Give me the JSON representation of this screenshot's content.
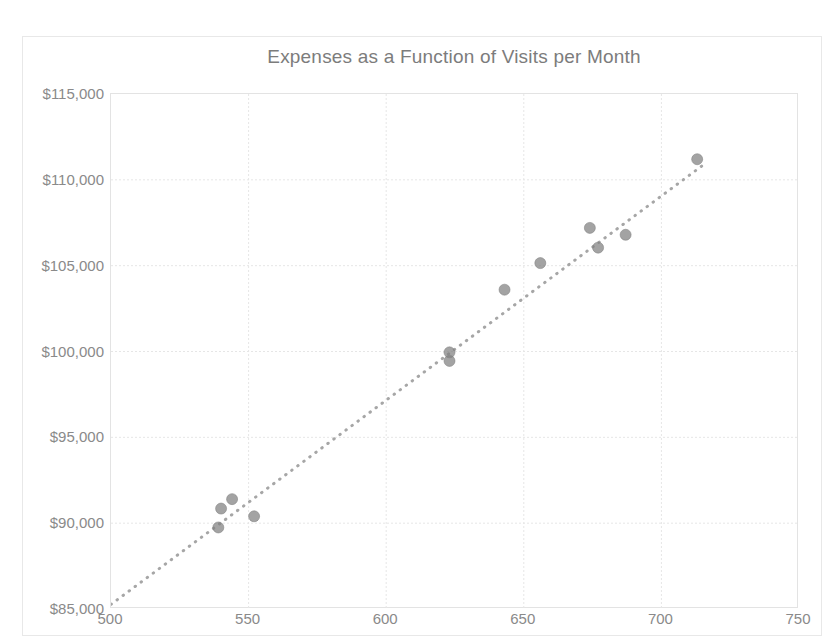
{
  "chart_data": {
    "type": "scatter",
    "title": "Expenses as a Function of Visits per Month",
    "xlabel": "",
    "ylabel": "",
    "xlim": [
      500,
      750
    ],
    "ylim": [
      85000,
      115000
    ],
    "grid": true,
    "legend": "none",
    "x_ticks": [
      "500",
      "550",
      "600",
      "650",
      "700",
      "750"
    ],
    "x_tick_values": [
      500,
      550,
      600,
      650,
      700,
      750
    ],
    "y_ticks": [
      "$85,000",
      "$90,000",
      "$95,000",
      "$100,000",
      "$105,000",
      "$110,000",
      "$115,000"
    ],
    "y_tick_values": [
      85000,
      90000,
      95000,
      100000,
      105000,
      110000,
      115000
    ],
    "marker_color": "#808080",
    "trendline_color": "#a6a6a6",
    "gridline_color": "#e6e6e6",
    "text_color": "#8a8a8a",
    "series": [
      {
        "name": "Expenses",
        "points": [
          [
            539,
            89750
          ],
          [
            540,
            90850
          ],
          [
            544,
            91400
          ],
          [
            552,
            90400
          ],
          [
            623,
            99950
          ],
          [
            623,
            99450
          ],
          [
            643,
            103600
          ],
          [
            656,
            105150
          ],
          [
            674,
            107200
          ],
          [
            677,
            106050
          ],
          [
            687,
            106800
          ],
          [
            713,
            111200
          ]
        ]
      }
    ],
    "trendline": {
      "type": "linear-dotted",
      "slope": 118.96,
      "intercept": 25787,
      "r_squared": 0.98684,
      "equation_text": "y = 118.96x + 25787",
      "r2_text_prefix": "R",
      "r2_text_sup": "2",
      "r2_text_suffix": " = 0.98684",
      "x_start": 500,
      "x_end": 716
    }
  }
}
